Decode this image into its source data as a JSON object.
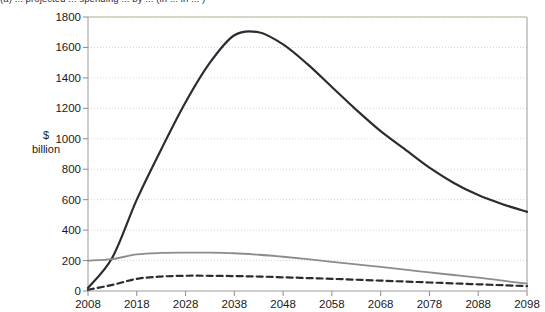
{
  "caption": "(a) ... projected ... spending ... by ... (in ... in ... )",
  "axis": {
    "y_title_line1": "$",
    "y_title_line2": "billion"
  },
  "chart_data": {
    "type": "line",
    "title": "",
    "xlabel": "",
    "ylabel": "$ billion",
    "xlim": [
      2008,
      2098
    ],
    "ylim": [
      0,
      1800
    ],
    "grid": "horizontal-dotted",
    "legend": "none",
    "xticks": [
      2008,
      2018,
      2028,
      2038,
      2048,
      2058,
      2068,
      2078,
      2088,
      2098
    ],
    "yticks": [
      0,
      200,
      400,
      600,
      800,
      1000,
      1200,
      1400,
      1600,
      1800
    ],
    "x": [
      2008,
      2013,
      2018,
      2023,
      2028,
      2033,
      2038,
      2043,
      2048,
      2053,
      2058,
      2063,
      2068,
      2073,
      2078,
      2083,
      2088,
      2093,
      2098
    ],
    "series": [
      {
        "name": "primary-projection",
        "style": "solid",
        "color": "#2b2b33",
        "width": 2.2,
        "values": [
          20,
          220,
          600,
          930,
          1240,
          1500,
          1680,
          1700,
          1620,
          1490,
          1340,
          1190,
          1050,
          930,
          810,
          710,
          630,
          570,
          520
        ]
      },
      {
        "name": "secondary-projection",
        "style": "solid",
        "color": "#8c8c8c",
        "width": 1.8,
        "values": [
          200,
          210,
          240,
          250,
          252,
          252,
          248,
          238,
          225,
          210,
          192,
          175,
          158,
          140,
          122,
          105,
          88,
          68,
          48
        ]
      },
      {
        "name": "tertiary-projection",
        "style": "dashed",
        "color": "#2b2b33",
        "width": 2.2,
        "values": [
          8,
          40,
          80,
          95,
          100,
          100,
          98,
          95,
          90,
          85,
          80,
          74,
          68,
          62,
          56,
          50,
          44,
          38,
          32
        ]
      }
    ]
  }
}
